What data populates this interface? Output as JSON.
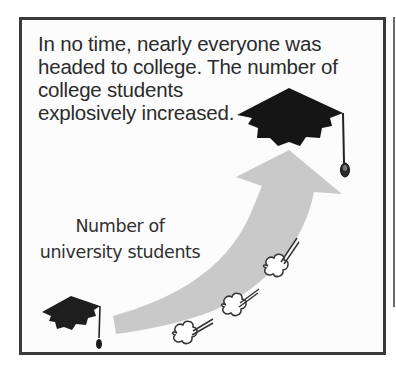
{
  "caption": {
    "lines": [
      "In no time, nearly everyone was",
      "headed to college. The number of",
      "college students",
      "explosively increased."
    ]
  },
  "arrow_label": {
    "lines": [
      "Number of",
      "university students"
    ]
  },
  "icons": {
    "start": "graduation-cap-icon",
    "end": "graduation-cap-icon",
    "arrow": "rising-arrow-icon",
    "puffs": "smoke-puff-icon"
  },
  "colors": {
    "frame": "#3a3a3a",
    "arrow": "#c9c9c9",
    "cap": "#1a1a1a",
    "text": "#2b2b2b"
  }
}
